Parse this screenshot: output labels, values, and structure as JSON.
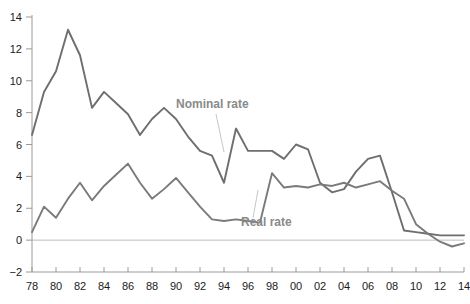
{
  "chart_data": {
    "type": "line",
    "title": "",
    "subtitle": "",
    "xlabel": "",
    "ylabel": "",
    "xlim": [
      1978,
      2014
    ],
    "ylim": [
      -2,
      14
    ],
    "grid": false,
    "legend_position": "inline-annotation",
    "zero_line": true,
    "x": [
      1978,
      1979,
      1980,
      1981,
      1982,
      1983,
      1984,
      1985,
      1986,
      1987,
      1988,
      1989,
      1990,
      1991,
      1992,
      1993,
      1994,
      1995,
      1996,
      1997,
      1998,
      1999,
      2000,
      2001,
      2002,
      2003,
      2004,
      2005,
      2006,
      2007,
      2008,
      2009,
      2010,
      2011,
      2012,
      2013,
      2014
    ],
    "x_tick_labels": [
      "78",
      "80",
      "82",
      "84",
      "86",
      "88",
      "90",
      "92",
      "94",
      "96",
      "98",
      "00",
      "02",
      "04",
      "06",
      "08",
      "10",
      "12",
      "14"
    ],
    "x_tick_values": [
      1978,
      1980,
      1982,
      1984,
      1986,
      1988,
      1990,
      1992,
      1994,
      1996,
      1998,
      2000,
      2002,
      2004,
      2006,
      2008,
      2010,
      2012,
      2014
    ],
    "y_tick_labels": [
      "-2",
      "0",
      "2",
      "4",
      "6",
      "8",
      "10",
      "12",
      "14"
    ],
    "y_tick_values": [
      -2,
      0,
      2,
      4,
      6,
      8,
      10,
      12,
      14
    ],
    "series": [
      {
        "name": "Nominal rate",
        "color": "#6e6e6e",
        "label_x": 2000,
        "values": [
          6.6,
          9.3,
          10.6,
          13.2,
          11.6,
          8.3,
          9.3,
          8.6,
          7.9,
          6.6,
          7.6,
          8.3,
          7.6,
          6.5,
          5.6,
          5.3,
          3.6,
          7.0,
          5.6,
          5.6,
          5.6,
          5.1,
          6.0,
          5.7,
          3.6,
          3.0,
          3.2,
          4.3,
          5.1,
          5.3,
          3.0,
          0.6,
          0.5,
          0.4,
          0.3,
          0.3,
          0.3
        ]
      },
      {
        "name": "Real rate",
        "color": "#7a7a7a",
        "label_x": 2001,
        "values": [
          0.5,
          2.1,
          1.4,
          2.6,
          3.6,
          2.5,
          3.4,
          4.1,
          4.8,
          3.6,
          2.6,
          3.2,
          3.9,
          3.0,
          2.1,
          1.3,
          1.2,
          1.3,
          1.2,
          1.1,
          4.2,
          3.3,
          3.4,
          3.3,
          3.5,
          3.4,
          3.6,
          3.3,
          3.5,
          3.7,
          3.1,
          2.6,
          1.0,
          0.4,
          -0.1,
          -0.4,
          -0.2
        ]
      }
    ],
    "annotations": [
      {
        "text": "Nominal rate",
        "name": "nominal-rate-label"
      },
      {
        "text": "Real rate",
        "name": "real-rate-label"
      }
    ]
  },
  "labels": {
    "nominal": "Nominal rate",
    "real": "Real rate"
  },
  "axes": {
    "y_ticks": [
      "14",
      "12",
      "10",
      "8",
      "6",
      "4",
      "2",
      "0",
      "-2"
    ],
    "x_ticks": [
      "78",
      "80",
      "82",
      "84",
      "86",
      "88",
      "90",
      "92",
      "94",
      "96",
      "98",
      "00",
      "02",
      "04",
      "06",
      "08",
      "10",
      "12",
      "14"
    ]
  },
  "colors": {
    "nominal_line": "#6e6e6e",
    "real_line": "#7a7a7a",
    "axis": "#9a9a9a",
    "zero_line": "#bdbdbd",
    "label_text": "#8a8a8a",
    "tick_text": "#1a1a1a",
    "background": "#ffffff"
  }
}
